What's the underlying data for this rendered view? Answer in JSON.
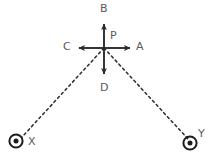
{
  "figure": {
    "title": "",
    "width": 217,
    "height": 158,
    "background_color": "#ffffff",
    "stroke_color": "#2b2b2b",
    "label_color": "#5a5a5a"
  },
  "labels": {
    "up": "B",
    "center": "P",
    "right": "A",
    "left": "C",
    "down": "D",
    "source_left": "X",
    "source_right": "Y"
  },
  "geometry": {
    "center": {
      "x": 104,
      "y": 48
    },
    "arrows": [
      {
        "name": "up-arrow",
        "label": "B",
        "from": {
          "x": 104,
          "y": 48
        },
        "to": {
          "x": 104,
          "y": 20
        }
      },
      {
        "name": "down-arrow",
        "label": "D",
        "from": {
          "x": 104,
          "y": 48
        },
        "to": {
          "x": 104,
          "y": 78
        }
      },
      {
        "name": "right-arrow",
        "label": "A",
        "from": {
          "x": 104,
          "y": 48
        },
        "to": {
          "x": 134,
          "y": 48
        }
      },
      {
        "name": "left-arrow",
        "label": "C",
        "from": {
          "x": 104,
          "y": 48
        },
        "to": {
          "x": 75,
          "y": 48
        }
      }
    ],
    "dashed_rays": [
      {
        "name": "ray-to-x",
        "from": {
          "x": 104,
          "y": 48
        },
        "to": {
          "x": 22,
          "y": 137
        }
      },
      {
        "name": "ray-to-y",
        "from": {
          "x": 104,
          "y": 48
        },
        "to": {
          "x": 189,
          "y": 140
        }
      }
    ],
    "markers": [
      {
        "name": "source-marker-x",
        "label": "X",
        "x": 16,
        "y": 141,
        "outer_radius": 7,
        "inner_radius": 2.6
      },
      {
        "name": "source-marker-y",
        "label": "Y",
        "x": 190,
        "y": 143,
        "outer_radius": 7,
        "inner_radius": 2.6
      }
    ]
  }
}
